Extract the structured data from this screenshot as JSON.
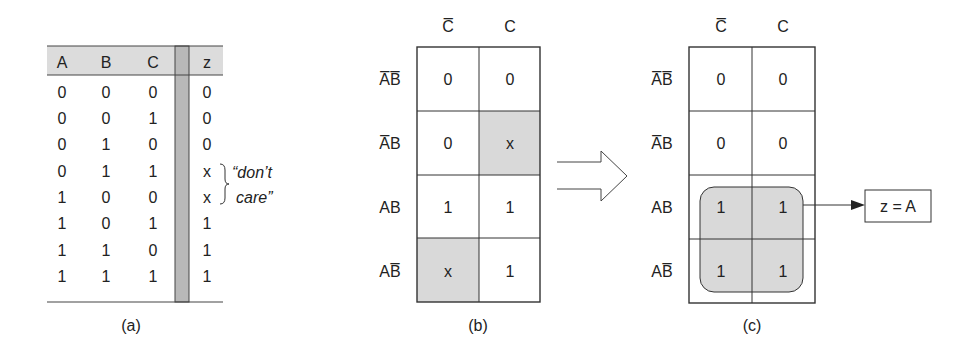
{
  "truth_table": {
    "headers": [
      "A",
      "B",
      "C",
      "z"
    ],
    "rows": [
      [
        "0",
        "0",
        "0",
        "0"
      ],
      [
        "0",
        "0",
        "1",
        "0"
      ],
      [
        "0",
        "1",
        "0",
        "0"
      ],
      [
        "0",
        "1",
        "1",
        "x"
      ],
      [
        "1",
        "0",
        "0",
        "x"
      ],
      [
        "1",
        "0",
        "1",
        "1"
      ],
      [
        "1",
        "1",
        "0",
        "1"
      ],
      [
        "1",
        "1",
        "1",
        "1"
      ]
    ],
    "annotation_line1": "“don’t",
    "annotation_line2": "care”",
    "caption": "(a)"
  },
  "kmap_b": {
    "col_headers": [
      "C̅",
      "C"
    ],
    "row_headers": [
      "A̅B̅",
      "A̅B",
      "AB",
      "AB̅"
    ],
    "cells": [
      [
        "0",
        "0"
      ],
      [
        "0",
        "x"
      ],
      [
        "1",
        "1"
      ],
      [
        "x",
        "1"
      ]
    ],
    "shaded": [
      [
        false,
        false
      ],
      [
        false,
        true
      ],
      [
        false,
        false
      ],
      [
        true,
        false
      ]
    ],
    "caption": "(b)"
  },
  "kmap_c": {
    "col_headers": [
      "C̅",
      "C"
    ],
    "row_headers": [
      "A̅B̅",
      "A̅B",
      "AB",
      "AB̅"
    ],
    "cells": [
      [
        "0",
        "0"
      ],
      [
        "0",
        "0"
      ],
      [
        "1",
        "1"
      ],
      [
        "1",
        "1"
      ]
    ],
    "caption": "(c)"
  },
  "result": {
    "expression": "z = A"
  },
  "colors": {
    "shade": "#d9d9d9",
    "shade_dark": "#b5b5b5",
    "line": "#333333"
  }
}
